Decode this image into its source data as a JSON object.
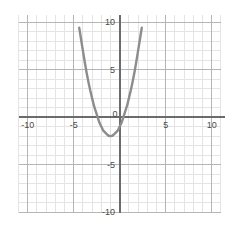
{
  "chart_data": {
    "type": "line",
    "title": "",
    "subtitle": "",
    "xlabel": "",
    "ylabel": "",
    "xlim": [
      -11.0,
      12.0
    ],
    "ylim": [
      -11.5,
      11.5
    ],
    "grid": true,
    "grid_minor_step": 1,
    "grid_major_step": 5,
    "legend": "none",
    "axes": {
      "x_axis_at_y": 0,
      "y_axis_at_x": 0,
      "x_ticks": [
        -10,
        -5,
        0,
        5,
        10
      ],
      "y_ticks": [
        10,
        5,
        0,
        -5,
        -10
      ],
      "x_tick_labels": [
        "-10",
        "-5",
        "0",
        "5",
        "10"
      ],
      "y_tick_labels": [
        "10",
        "5",
        "0",
        "-5",
        "-10"
      ]
    },
    "curve": {
      "name": "parabola",
      "equation": "y = x^2 + 2x - 1",
      "color": "#8d8d8d",
      "line_width": 2.4,
      "vertex": [
        -1,
        -2
      ],
      "x_intercepts": [
        -2.4,
        0.4
      ],
      "y_intercept": -1,
      "x": [
        -4.6,
        -4.4,
        -4.2,
        -4.0,
        -3.8,
        -3.6,
        -3.4,
        -3.2,
        -3.0,
        -2.8,
        -2.6,
        -2.4,
        -2.2,
        -2.0,
        -1.8,
        -1.6,
        -1.4,
        -1.2,
        -1.0,
        -0.8,
        -0.6,
        -0.4,
        -0.2,
        0.0,
        0.2,
        0.4,
        0.6,
        0.8,
        1.0,
        1.2,
        1.4,
        1.6,
        1.8,
        2.0,
        2.2,
        2.4,
        2.6
      ],
      "y": [
        11.0,
        9.4,
        8.2,
        7.0,
        5.8,
        4.7,
        3.7,
        2.8,
        2.0,
        1.2,
        0.6,
        0.0,
        -0.6,
        -1.0,
        -1.4,
        -1.6,
        -1.8,
        -1.96,
        -2.0,
        -1.96,
        -1.8,
        -1.6,
        -1.4,
        -1.0,
        -0.6,
        0.0,
        0.6,
        1.2,
        2.0,
        2.8,
        3.7,
        4.7,
        5.8,
        7.0,
        8.2,
        9.4,
        11.0
      ]
    }
  },
  "labels": {
    "x": {
      "neg_ten": "-10",
      "neg_five": "-5",
      "zero": "0",
      "pos_five": "5",
      "pos_ten": "10"
    },
    "y": {
      "pos_ten": "10",
      "pos_five": "5",
      "neg_five": "-5",
      "neg_ten": "-10"
    }
  },
  "colors": {
    "curve": "#8d8d8d",
    "axis": "#6b6b6b",
    "grid_major": "#b8b8b8",
    "grid_minor": "#e2e2e2",
    "label_text": "#4a4a4a",
    "background": "#ffffff"
  }
}
